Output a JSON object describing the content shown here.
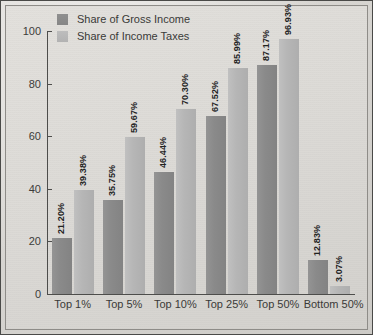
{
  "chart_data": {
    "type": "bar",
    "title": "",
    "xlabel": "",
    "ylabel": "",
    "ylim": [
      0,
      100
    ],
    "yticks": [
      0,
      20,
      40,
      60,
      80,
      100
    ],
    "grid": false,
    "legend_position": "top-left",
    "categories": [
      "Top 1%",
      "Top 5%",
      "Top 10%",
      "Top 25%",
      "Top 50%",
      "Bottom 50%"
    ],
    "series": [
      {
        "name": "Share of Gross Income",
        "color": "#8a8a8a",
        "values": [
          21.2,
          35.75,
          46.44,
          67.52,
          87.17,
          12.83
        ],
        "labels": [
          "21.20%",
          "35.75%",
          "46.44%",
          "67.52%",
          "87.17%",
          "12.83%"
        ]
      },
      {
        "name": "Share of Income Taxes",
        "color": "#b4b4b4",
        "values": [
          39.38,
          59.67,
          70.3,
          85.99,
          96.93,
          3.07
        ],
        "labels": [
          "39.38%",
          "59.67%",
          "70.30%",
          "85.99%",
          "96.93%",
          "3.07%"
        ]
      }
    ]
  },
  "axis": {
    "tick_labels": [
      "0",
      "20",
      "40",
      "60",
      "80",
      "100"
    ]
  }
}
